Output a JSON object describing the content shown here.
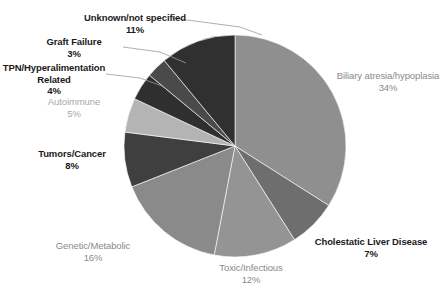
{
  "chart_data": {
    "type": "pie",
    "title": "",
    "subtitle": "",
    "xlabel": "",
    "ylabel": "",
    "legend_position": "none",
    "grid": false,
    "labels_show_percent": true,
    "start_angle_deg": 0,
    "direction": "clockwise",
    "categories": [
      "Biliary atresia/hypoplasia",
      "Cholestatic Liver Disease",
      "Toxic/Infectious",
      "Genetic/Metabolic",
      "Tumors/Cancer",
      "Autoimmune",
      "TPN/Hyperalimentation Related",
      "Graft Failure",
      "Unknown/not specified"
    ],
    "values": [
      34,
      7,
      12,
      16,
      8,
      5,
      4,
      3,
      11
    ],
    "value_labels": [
      "34%",
      "7%",
      "12%",
      "16%",
      "8%",
      "5%",
      "4%",
      "3%",
      "11%"
    ],
    "colors": [
      "#8f8f8f",
      "#6e6e6e",
      "#949494",
      "#8a8a8a",
      "#3f3f3f",
      "#b4b4b4",
      "#2f2f2f",
      "#4a4a4a",
      "#303030"
    ],
    "units": "percent",
    "total": 100
  },
  "labels": {
    "biliary": {
      "name": "Biliary atresia/hypoplasia",
      "pct": "34%"
    },
    "cholestatic": {
      "name": "Cholestatic  Liver  Disease",
      "pct": "7%"
    },
    "toxic": {
      "name": "Toxic/Infectious",
      "pct": "12%"
    },
    "genetic": {
      "name": "Genetic/Metabolic",
      "pct": "16%"
    },
    "tumors": {
      "name": "Tumors/Cancer",
      "pct": "8%"
    },
    "autoimmune": {
      "name": "Autoimmune",
      "pct": "5%"
    },
    "tpn": {
      "name": "TPN/Hyperalimentation",
      "name2": "Related",
      "pct": "4%"
    },
    "graft": {
      "name": "Graft Failure",
      "pct": "3%"
    },
    "unknown": {
      "name": "Unknown/not  specified",
      "pct": "11%"
    }
  }
}
